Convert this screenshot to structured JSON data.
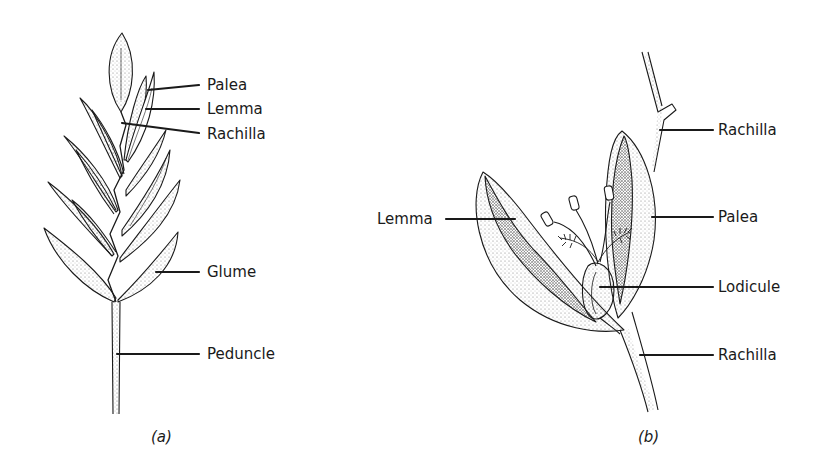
{
  "panel_a": {
    "caption": "(a)",
    "labels": {
      "palea": "Palea",
      "lemma": "Lemma",
      "rachilla": "Rachilla",
      "glume": "Glume",
      "peduncle": "Peduncle"
    }
  },
  "panel_b": {
    "caption": "(b)",
    "labels": {
      "rachilla_top": "Rachilla",
      "lemma": "Lemma",
      "palea": "Palea",
      "lodicule": "Lodicule",
      "rachilla_bottom": "Rachilla"
    }
  },
  "colors": {
    "ink": "#1a1a1a",
    "stipple": "#8a8a8a",
    "background": "#ffffff"
  }
}
